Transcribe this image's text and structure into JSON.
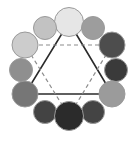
{
  "figure": {
    "background_color": "#ffffff",
    "canvas": {
      "width": 136,
      "height": 142
    },
    "center": {
      "x": 68.5,
      "y": 70.5
    }
  },
  "chart_data": {
    "type": "scatter",
    "title": "",
    "xlabel": "",
    "ylabel": "",
    "xlim": [
      0,
      136
    ],
    "ylim": [
      0,
      142
    ],
    "grid": false,
    "legend": "none",
    "categories": [
      "top-center",
      "upper-left",
      "upper-right",
      "left-upper",
      "right-upper",
      "left-middle",
      "right-middle",
      "left-lower",
      "right-lower",
      "bottom-left",
      "bottom-right",
      "bottom-center"
    ],
    "points": [
      {
        "name": "top-center",
        "x": 69,
        "y": 22,
        "r": 14.5,
        "fill": "#e6e6e6",
        "stroke": "#9a9a9a",
        "role": "primary",
        "value": 0.9
      },
      {
        "name": "upper-left",
        "x": 45,
        "y": 28,
        "r": 11.5,
        "fill": "#c2c2c2",
        "stroke": "#9a9a9a",
        "role": "tertiary",
        "value": 0.76
      },
      {
        "name": "upper-right",
        "x": 93,
        "y": 28,
        "r": 11.5,
        "fill": "#9d9d9d",
        "stroke": "#8a8a8a",
        "role": "tertiary",
        "value": 0.62
      },
      {
        "name": "left-upper",
        "x": 25,
        "y": 45,
        "r": 13.0,
        "fill": "#cccccc",
        "stroke": "#9a9a9a",
        "role": "secondary",
        "value": 0.8
      },
      {
        "name": "right-upper",
        "x": 112,
        "y": 45,
        "r": 13.0,
        "fill": "#4d4d4d",
        "stroke": "#4a4a4a",
        "role": "secondary",
        "value": 0.3
      },
      {
        "name": "left-middle",
        "x": 21,
        "y": 70,
        "r": 11.5,
        "fill": "#8f8f8f",
        "stroke": "#868686",
        "role": "tertiary",
        "value": 0.56
      },
      {
        "name": "right-middle",
        "x": 116,
        "y": 70,
        "r": 11.5,
        "fill": "#3a3a3a",
        "stroke": "#383838",
        "role": "tertiary",
        "value": 0.23
      },
      {
        "name": "left-lower",
        "x": 25,
        "y": 94,
        "r": 13.0,
        "fill": "#767676",
        "stroke": "#707070",
        "role": "primary",
        "value": 0.46
      },
      {
        "name": "right-lower",
        "x": 112,
        "y": 94,
        "r": 13.0,
        "fill": "#9b9b9b",
        "stroke": "#8a8a8a",
        "role": "primary",
        "value": 0.61
      },
      {
        "name": "bottom-left",
        "x": 45,
        "y": 112,
        "r": 11.5,
        "fill": "#434343",
        "stroke": "#404040",
        "role": "tertiary",
        "value": 0.26
      },
      {
        "name": "bottom-right",
        "x": 93,
        "y": 112,
        "r": 11.5,
        "fill": "#444444",
        "stroke": "#404040",
        "role": "tertiary",
        "value": 0.27
      },
      {
        "name": "bottom-center",
        "x": 69,
        "y": 116,
        "r": 14.5,
        "fill": "#2b2b2b",
        "stroke": "#282828",
        "role": "secondary",
        "value": 0.17
      }
    ],
    "edges": [
      {
        "name": "solid-triangle",
        "style": "solid",
        "color": "#2b2b2b",
        "width": 1.6,
        "vertices": [
          "top-center",
          "right-lower",
          "left-lower"
        ],
        "path": "69,22 112,94 25,94 69,22"
      },
      {
        "name": "dashed-triangle",
        "style": "dashed",
        "color": "#8c8c8c",
        "width": 1.2,
        "vertices": [
          "left-upper",
          "right-upper",
          "bottom-center"
        ],
        "path": "25,45 112,45 69,116 25,45"
      }
    ]
  }
}
